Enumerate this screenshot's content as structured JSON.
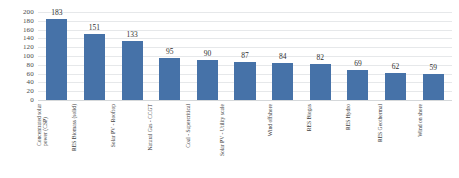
{
  "chart_data": {
    "type": "bar",
    "title": "",
    "subtitle": "",
    "xlabel": "",
    "ylabel": "",
    "ylim": [
      0,
      200
    ],
    "ytick_step": 20,
    "yticks": [
      200,
      180,
      160,
      140,
      120,
      100,
      80,
      60,
      40,
      20,
      0
    ],
    "grid": true,
    "legend": false,
    "legend_position": "none",
    "bar_color": "#4672a8",
    "data_labels": true,
    "categories": [
      "Concentrated solar\npower (CSP)",
      "RES Biomass (solid)",
      "Solar PV - Rooftop",
      "Natural Gas - CCGT",
      "Coal - Supercritical",
      "Solar PV - Utility scale",
      "Wind offshore",
      "RES Biogas",
      "RES Hydro",
      "RES Geothermal",
      "Wind on shore"
    ],
    "values": [
      183,
      151,
      133,
      95,
      90,
      87,
      84,
      82,
      69,
      62,
      59
    ],
    "points": [
      {
        "category": "Concentrated solar\npower (CSP)",
        "value": 183,
        "label": "183"
      },
      {
        "category": "RES Biomass (solid)",
        "value": 151,
        "label": "151"
      },
      {
        "category": "Solar PV - Rooftop",
        "value": 133,
        "label": "133"
      },
      {
        "category": "Natural Gas - CCGT",
        "value": 95,
        "label": "95"
      },
      {
        "category": "Coal - Supercritical",
        "value": 90,
        "label": "90"
      },
      {
        "category": "Solar PV - Utility scale",
        "value": 87,
        "label": "87"
      },
      {
        "category": "Wind offshore",
        "value": 84,
        "label": "84"
      },
      {
        "category": "RES Biogas",
        "value": 82,
        "label": "82"
      },
      {
        "category": "RES Hydro",
        "value": 69,
        "label": "69"
      },
      {
        "category": "RES Geothermal",
        "value": 62,
        "label": "62"
      },
      {
        "category": "Wind on shore",
        "value": 59,
        "label": "59"
      }
    ]
  },
  "colors": {
    "bar": "#4672a8",
    "gridline": "#e6e8ea",
    "baseline": "#d5d8da",
    "text": "#3a3a3a",
    "background": "#ffffff"
  }
}
